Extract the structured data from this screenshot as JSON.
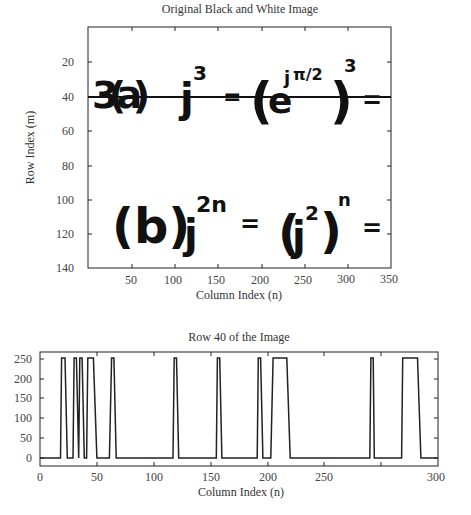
{
  "chart_data": [
    {
      "type": "heatmap",
      "title": "Original Black and White Image",
      "xlabel": "Column Index (n)",
      "ylabel": "Row Index (m)",
      "xlim": [
        1,
        350
      ],
      "ylim": [
        140,
        1
      ],
      "xticks": [
        50,
        100,
        150,
        200,
        250,
        300,
        350
      ],
      "yticks": [
        20,
        40,
        60,
        80,
        100,
        120,
        140
      ],
      "annotations": [
        {
          "type": "hline",
          "y": 40,
          "label": "Row 40 marker"
        }
      ],
      "image_content": {
        "line_a": "3(a)   j^3 = (e^{jπ/2})^3 =",
        "line_b": "(b)   j^{2n} = (j^2)^n ="
      },
      "grid": false
    },
    {
      "type": "line",
      "title": "Row 40 of the Image",
      "xlabel": "Column Index (n)",
      "ylabel": "",
      "xlim": [
        0,
        350
      ],
      "ylim": [
        -20,
        270
      ],
      "xticks": [
        0,
        50,
        100,
        150,
        200,
        250,
        300,
        350
      ],
      "yticks": [
        0,
        50,
        100,
        150,
        200,
        250
      ],
      "grid": false,
      "series": [
        {
          "name": "Row 40 intensity",
          "x": [
            0,
            18,
            19,
            22,
            24,
            29,
            30,
            32,
            34,
            35,
            37,
            39,
            41,
            42,
            47,
            50,
            61,
            63,
            65,
            67,
            117,
            118,
            120,
            122,
            155,
            156,
            158,
            160,
            191,
            192,
            194,
            196,
            203,
            205,
            217,
            220,
            290,
            291,
            293,
            294,
            318,
            319,
            332,
            335,
            350
          ],
          "values": [
            0,
            0,
            255,
            255,
            0,
            0,
            255,
            255,
            0,
            255,
            255,
            0,
            0,
            255,
            255,
            0,
            0,
            255,
            255,
            0,
            0,
            255,
            255,
            0,
            0,
            255,
            255,
            0,
            0,
            255,
            255,
            0,
            0,
            255,
            255,
            0,
            0,
            255,
            255,
            0,
            0,
            255,
            255,
            0,
            0
          ]
        }
      ]
    }
  ]
}
